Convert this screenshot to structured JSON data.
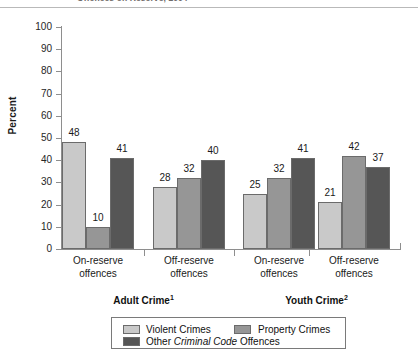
{
  "figure": {
    "partial_title": "Offences on Reserve, 2004",
    "axis_title": "Percent"
  },
  "chart_data": {
    "type": "bar",
    "title": "Offences on Reserve, 2004",
    "xlabel": "",
    "ylabel": "Percent",
    "ylim": [
      0,
      100
    ],
    "yticks": [
      0,
      10,
      20,
      30,
      40,
      50,
      60,
      70,
      80,
      90,
      100
    ],
    "ytick_labels": [
      "0",
      "10",
      "20",
      "30",
      "40",
      "50",
      "60",
      "70",
      "80",
      "90",
      "100"
    ],
    "grid": false,
    "legend_position": "bottom",
    "categories": [
      "On-reserve offences",
      "Off-reserve offences",
      "On-reserve offences",
      "Off-reserve offences"
    ],
    "category_lines": [
      [
        "On-reserve",
        "offences"
      ],
      [
        "Off-reserve",
        "offences"
      ],
      [
        "On-reserve",
        "offences"
      ],
      [
        "Off-reserve",
        "offences"
      ]
    ],
    "super_groups": [
      {
        "label": "Adult Crime",
        "footnote": "1",
        "categories": [
          0,
          1
        ]
      },
      {
        "label": "Youth Crime",
        "footnote": "2",
        "categories": [
          2,
          3
        ]
      }
    ],
    "series": [
      {
        "name": "Violent Crimes",
        "color": "#c9c9c9",
        "values": [
          48,
          28,
          25,
          21
        ]
      },
      {
        "name": "Property Crimes",
        "color": "#969696",
        "values": [
          10,
          32,
          32,
          42
        ]
      },
      {
        "name": "Other Criminal Code Offences",
        "color": "#565656",
        "values": [
          41,
          40,
          41,
          37
        ]
      }
    ],
    "data_labels": [
      [
        "48",
        "10",
        "41"
      ],
      [
        "28",
        "32",
        "40"
      ],
      [
        "25",
        "32",
        "41"
      ],
      [
        "21",
        "42",
        "37"
      ]
    ]
  },
  "legend": {
    "entries": [
      {
        "label": "Violent Crimes",
        "color": "#c9c9c9"
      },
      {
        "label": "Property Crimes",
        "color": "#969696"
      },
      {
        "label_pre": "Other ",
        "label_italic": "Criminal Code",
        "label_post": " Offences",
        "color": "#565656"
      }
    ]
  }
}
